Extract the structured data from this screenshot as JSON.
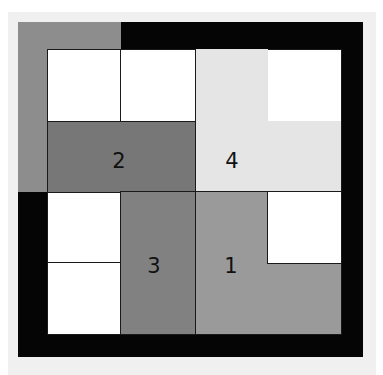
{
  "diagram": {
    "type": "sliding-block-puzzle",
    "colors": {
      "frame": "#050505",
      "corner_piece": "#8d8d8d",
      "piece_1": "#9a9a9a",
      "piece_2": "#777777",
      "piece_3": "#818181",
      "piece_4": "#e5e5e5",
      "empty": "#ffffff",
      "background": "#f0f0f0"
    },
    "pieces": [
      {
        "id": "1",
        "label": "1"
      },
      {
        "id": "2",
        "label": "2"
      },
      {
        "id": "3",
        "label": "3"
      },
      {
        "id": "4",
        "label": "4"
      }
    ]
  }
}
